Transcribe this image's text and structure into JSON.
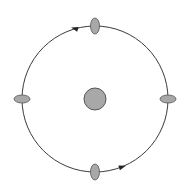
{
  "diagram": {
    "type": "orbit",
    "colors": {
      "background": "#ffffff",
      "orbit_stroke": "#3a3a3a",
      "body_fill": "#a8a8a8",
      "body_stroke": "#555555",
      "arrow": "#222222"
    },
    "central_body": {
      "cx": 95,
      "cy": 99,
      "r": 11
    },
    "orbit": {
      "cx": 95,
      "cy": 99,
      "r": 73,
      "direction": "counterclockwise"
    },
    "orbiting_bodies": [
      {
        "position": "top",
        "cx": 95,
        "cy": 26,
        "rx": 4.5,
        "ry": 8
      },
      {
        "position": "left",
        "cx": 22,
        "cy": 99,
        "rx": 8,
        "ry": 4
      },
      {
        "position": "right",
        "cx": 168,
        "cy": 99,
        "rx": 8,
        "ry": 4
      },
      {
        "position": "bottom",
        "cx": 95,
        "cy": 172,
        "rx": 4.5,
        "ry": 8
      }
    ],
    "arrows": [
      {
        "position": "top-left",
        "x": 75,
        "y": 28.5,
        "angle": 196
      },
      {
        "position": "bottom-right",
        "x": 122,
        "y": 167,
        "angle": -18
      }
    ]
  }
}
